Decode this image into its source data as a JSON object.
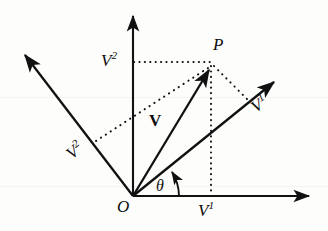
{
  "figure": {
    "kind": "vector-decomposition-diagram",
    "width": 328,
    "height": 231,
    "background_color": "#fdfdfc",
    "stroke_color": "#111111"
  },
  "labels": {
    "origin": "O",
    "point": "P",
    "vector_bold": "V",
    "angle": "θ",
    "component_x_axis": "V",
    "component_x_axis_sup": "1",
    "component_y_axis": "V",
    "component_y_axis_sup": "2",
    "basis_right": "V",
    "basis_right_sup": "1",
    "basis_left": "V",
    "basis_left_sup": "2"
  },
  "geometry": {
    "origin": [
      133,
      196
    ],
    "point_p": [
      211,
      66
    ],
    "y_axis_tip": [
      133,
      12
    ],
    "x_axis_tip": [
      313,
      196
    ],
    "basis_right_tip": [
      278,
      78
    ],
    "basis_left_tip": [
      21,
      51
    ],
    "dotted_horizontal_from": [
      133,
      62
    ],
    "dotted_horizontal_to": [
      211,
      62
    ],
    "dotted_vertical_from": [
      211,
      66
    ],
    "dotted_vertical_to": [
      211,
      196
    ],
    "dotted_diag_left_to": [
      96,
      141
    ],
    "dotted_diag_right_to": [
      247,
      99
    ],
    "theta_arc_radius": 44,
    "theta_degrees": 33
  },
  "annotations": {
    "description": "Vector V from origin O to point P decomposed into contravariant components along oblique basis directions"
  }
}
